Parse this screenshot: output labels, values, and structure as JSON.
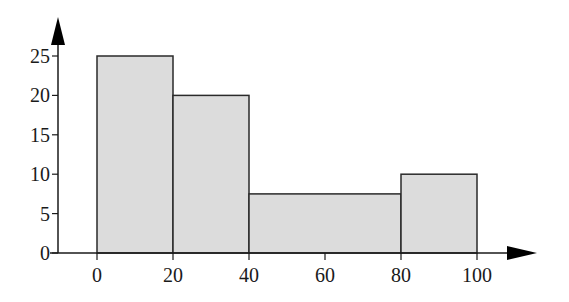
{
  "chart_data": {
    "type": "bar",
    "subtype": "histogram",
    "title": "",
    "xlabel": "",
    "ylabel": "",
    "bins": [
      {
        "start": 0,
        "end": 20,
        "value": 25
      },
      {
        "start": 20,
        "end": 40,
        "value": 20
      },
      {
        "start": 40,
        "end": 80,
        "value": 7.5
      },
      {
        "start": 80,
        "end": 100,
        "value": 10
      }
    ],
    "categories": [
      "0-20",
      "20-40",
      "40-80",
      "80-100"
    ],
    "values": [
      25,
      20,
      7.5,
      10
    ],
    "x_ticks": [
      "0",
      "20",
      "40",
      "60",
      "80",
      "100"
    ],
    "y_ticks": [
      "0",
      "5",
      "10",
      "15",
      "20",
      "25"
    ],
    "xlim": [
      0,
      100
    ],
    "ylim": [
      0,
      25
    ],
    "grid": false,
    "legend": null,
    "colors": {
      "bar_fill": "#dcdcdc",
      "bar_stroke": "#2a2a2a",
      "axis": "#1a1a1a"
    }
  }
}
